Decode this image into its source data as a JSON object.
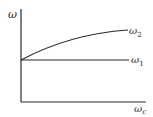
{
  "diagram": {
    "y_axis_label": "ω",
    "x_axis_label_main": "ω",
    "x_axis_label_sub": "c",
    "curves": [
      {
        "name": "ω₂",
        "label_main": "ω",
        "label_sub": "2",
        "shape": "concave rising curve from y-axis intercept"
      },
      {
        "name": "ω₁",
        "label_main": "ω",
        "label_sub": "1",
        "shape": "horizontal line at y-axis intercept"
      }
    ],
    "colors": {
      "line": "#2a2a2a",
      "background": "#ffffff"
    }
  }
}
